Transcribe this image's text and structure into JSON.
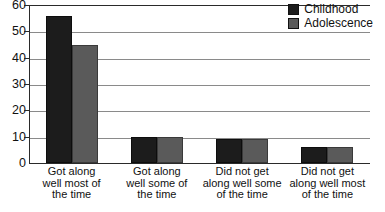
{
  "chart_data": {
    "type": "bar",
    "title": "",
    "subtitle": "",
    "xlabel": "",
    "ylabel": "",
    "ylim": [
      0,
      60
    ],
    "yticks": [
      0,
      10,
      20,
      30,
      40,
      50,
      60
    ],
    "ytick_labels": [
      "0",
      "10",
      "20",
      "30",
      "40",
      "50",
      "60"
    ],
    "grid": true,
    "grid_axis": "y",
    "legend_position": "top-right",
    "categories": [
      "Got along well most of the time",
      "Got along well some of the time",
      "Did not get along well some of the time",
      "Did not get along well most of the time"
    ],
    "category_lines": [
      [
        "Got along",
        "well most of",
        "the time"
      ],
      [
        "Got along",
        "well some of",
        "the time"
      ],
      [
        "Did not get",
        "along well some",
        "of the time"
      ],
      [
        "Did not get",
        "along well most",
        "of the time"
      ]
    ],
    "series": [
      {
        "name": "Childhood",
        "color": "#1c1c1c",
        "values": [
          56,
          10,
          9,
          6
        ]
      },
      {
        "name": "Adolescence",
        "color": "#5a5a5a",
        "values": [
          45,
          10,
          9,
          6
        ]
      }
    ]
  },
  "legend": {
    "items": [
      {
        "label": "Childhood",
        "color": "#1c1c1c"
      },
      {
        "label": "Adolescence",
        "color": "#5a5a5a"
      }
    ]
  },
  "colors": {
    "childhood": "#1c1c1c",
    "adolescence": "#5a5a5a",
    "axis": "#2a2a2a",
    "grid": "#8a8a8a",
    "text": "#111111",
    "background": "#ffffff"
  }
}
